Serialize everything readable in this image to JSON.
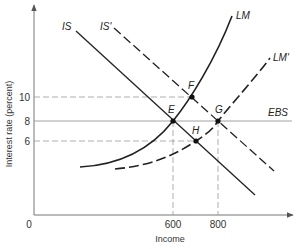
{
  "diagram": {
    "type": "IS-LM with external balance",
    "axes": {
      "x": {
        "label": "Income",
        "origin_label": "0",
        "ticks": [
          {
            "value": "600",
            "x": 173
          },
          {
            "value": "800",
            "x": 218
          }
        ]
      },
      "y": {
        "label": "Interest rate (percent)",
        "ticks": [
          {
            "value": "10",
            "y": 97
          },
          {
            "value": "8",
            "y": 121
          },
          {
            "value": "6",
            "y": 141
          }
        ]
      }
    },
    "curves": {
      "IS": {
        "label": "IS",
        "style": "solid"
      },
      "IS_prime": {
        "label": "IS'",
        "style": "dashed"
      },
      "LM": {
        "label": "LM",
        "style": "solid"
      },
      "LM_prime": {
        "label": "LM'",
        "style": "dashed"
      },
      "EBS": {
        "label": "EBS",
        "style": "solid-thin"
      }
    },
    "points": {
      "E": {
        "label": "E",
        "income": 600,
        "interest": 8
      },
      "F": {
        "label": "F",
        "income": 700,
        "interest": 10
      },
      "G": {
        "label": "G",
        "income": 800,
        "interest": 8
      },
      "H": {
        "label": "H",
        "income": 700,
        "interest": 6
      }
    }
  }
}
